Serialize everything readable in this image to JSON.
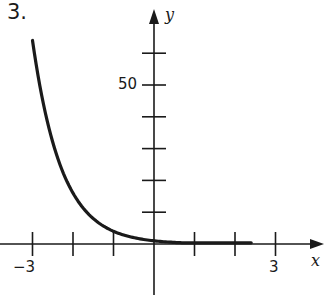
{
  "problem_number": "3.",
  "chart_data": {
    "type": "line",
    "title": "",
    "function": "y = (1/4)^x",
    "xlabel": "x",
    "ylabel": "y",
    "xlim": [
      -3.2,
      4
    ],
    "ylim": [
      -15,
      72
    ],
    "x_ticks": [
      -3,
      -2,
      -1,
      1,
      2,
      3
    ],
    "x_tick_labels": [
      {
        "value": -3,
        "label": "−3"
      },
      {
        "value": 3,
        "label": "3"
      }
    ],
    "y_ticks": [
      10,
      20,
      30,
      40,
      50,
      60
    ],
    "y_tick_labels": [
      {
        "value": 50,
        "label": "50"
      }
    ],
    "grid": false,
    "legend": null,
    "series": [
      {
        "name": "curve",
        "x": [
          -3,
          -2.5,
          -2,
          -1.5,
          -1,
          -0.5,
          0,
          0.5,
          1,
          1.5,
          2,
          2.4
        ],
        "y": [
          64,
          32,
          16,
          8,
          4,
          2,
          1,
          0.5,
          0.25,
          0.125,
          0.0625,
          0.036
        ]
      }
    ]
  },
  "labels": {
    "x_axis": "x",
    "y_axis": "y",
    "x_neg3": "−3",
    "x_pos3": "3",
    "y_50": "50"
  },
  "colors": {
    "ink": "#1a1a1a",
    "background": "#ffffff"
  }
}
